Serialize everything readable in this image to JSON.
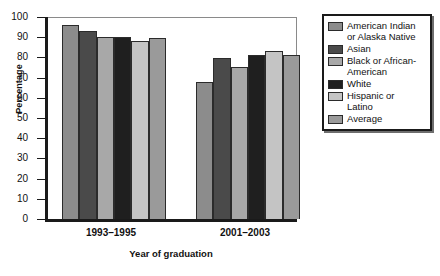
{
  "chart_data": {
    "type": "bar",
    "title": "",
    "xlabel": "Year of graduation",
    "ylabel": "Percentage",
    "categories": [
      "1993–1995",
      "2001–2003"
    ],
    "ylim": [
      0,
      100
    ],
    "yticks": [
      0,
      10,
      20,
      30,
      40,
      50,
      60,
      70,
      80,
      90,
      100
    ],
    "grid": false,
    "legend_position": "right",
    "series": [
      {
        "name": "American Indian or Alaska Native",
        "label_lines": "American Indian\nor Alaska Native",
        "color": "#8c8c8c",
        "values": [
          96,
          68
        ]
      },
      {
        "name": "Asian",
        "label_lines": "Asian",
        "color": "#4a4a4a",
        "values": [
          93,
          79.5
        ]
      },
      {
        "name": "Black or African-American",
        "label_lines": "Black or African-\nAmerican",
        "color": "#a8a8a8",
        "values": [
          90,
          75.5
        ]
      },
      {
        "name": "White",
        "label_lines": "White",
        "color": "#1f1f1f",
        "values": [
          90,
          81
        ]
      },
      {
        "name": "Hispanic or Latino",
        "label_lines": "Hispanic or\nLatino",
        "color": "#c4c4c4",
        "values": [
          88,
          83
        ]
      },
      {
        "name": "Average",
        "label_lines": "Average",
        "color": "#9a9a9a",
        "values": [
          89.5,
          81
        ]
      }
    ]
  }
}
